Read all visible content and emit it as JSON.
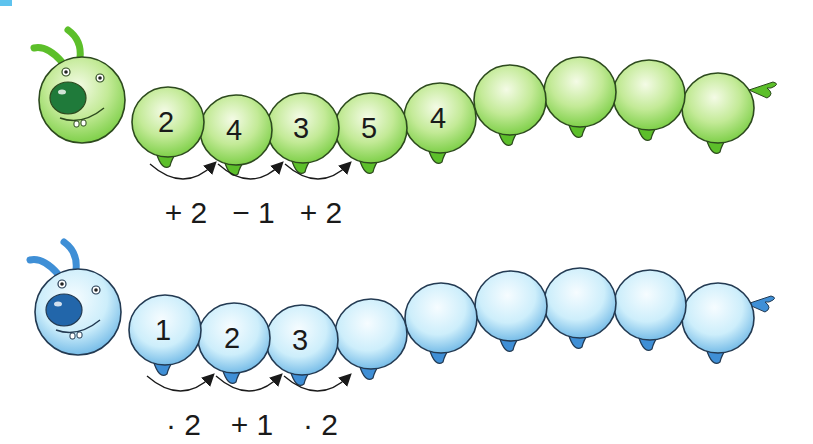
{
  "caterpillars": [
    {
      "name": "green",
      "colors": {
        "body": "#b8e68a",
        "light": "#eef9d8",
        "dark": "#5cbf2a",
        "nose": "#1f7a3a",
        "outline": "#2d4a1e"
      },
      "segments": [
        "2",
        "4",
        "3",
        "5",
        "4",
        "",
        "",
        "",
        ""
      ],
      "operations": [
        "+ 2",
        "− 1",
        "+ 2"
      ]
    },
    {
      "name": "blue",
      "colors": {
        "body": "#bfe6f7",
        "light": "#f2fbff",
        "dark": "#3f8fd6",
        "nose": "#2266aa",
        "outline": "#233a52"
      },
      "segments": [
        "1",
        "2",
        "3",
        "",
        "",
        "",
        "",
        "",
        ""
      ],
      "operations": [
        "· 2",
        "+ 1",
        "· 2"
      ]
    }
  ],
  "corner_marker_color": "#5ec3ee"
}
